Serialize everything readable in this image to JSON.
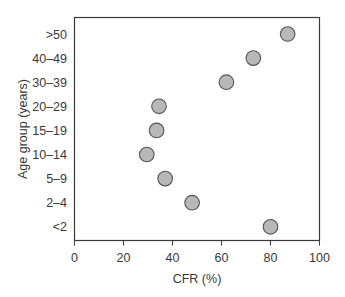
{
  "chart_data": {
    "type": "scatter",
    "title": "",
    "xlabel": "CFR (%)",
    "ylabel": "Age group (years)",
    "xlim": [
      0,
      100
    ],
    "xticks": [
      0,
      20,
      40,
      60,
      80,
      100
    ],
    "categories": [
      ">50",
      "40–49",
      "30–39",
      "20–29",
      "15–19",
      "10–14",
      "5–9",
      "2–4",
      "<2"
    ],
    "values": [
      87,
      73,
      62,
      34.5,
      33.5,
      29.5,
      37,
      48,
      80
    ],
    "grid": false,
    "legend": null,
    "marker": {
      "shape": "circle",
      "fill": "#b8b8b8",
      "stroke": "#555555"
    }
  }
}
